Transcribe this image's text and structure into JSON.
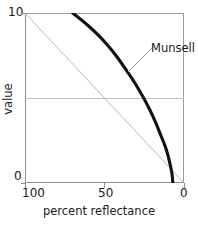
{
  "chart_data": {
    "type": "line",
    "title": "",
    "xlabel": "percent reflectance",
    "ylabel": "value",
    "xlim": [
      100,
      0
    ],
    "ylim": [
      0,
      10
    ],
    "x_reversed": true,
    "grid": "horizontal gridline at value = 5",
    "legend": "none (inline annotation)",
    "xticks": [
      100,
      50,
      0
    ],
    "xtick_labels": [
      "100",
      "50",
      "0"
    ],
    "yticks": [
      0,
      10
    ],
    "ytick_labels": [
      "0",
      "10"
    ],
    "annotations": [
      {
        "text": "Munsell",
        "points_to_series": "Munsell"
      }
    ],
    "series": [
      {
        "name": "Munsell",
        "style": "thick-black-curve",
        "color": "#111111",
        "width": 3.1,
        "x": [
          70,
          62,
          55,
          48,
          42,
          36,
          31,
          26,
          22,
          18,
          15,
          12,
          10,
          8.5,
          7.5,
          7
        ],
        "y": [
          10,
          9.4,
          8.8,
          8.1,
          7.4,
          6.6,
          5.9,
          5.1,
          4.4,
          3.6,
          2.9,
          2.2,
          1.6,
          1.0,
          0.5,
          0
        ]
      },
      {
        "name": "linear reference",
        "style": "thin-gray-line",
        "color": "#b0b0b0",
        "width": 0.9,
        "x": [
          100,
          0
        ],
        "y": [
          10,
          0
        ]
      }
    ]
  },
  "axes": {
    "y_top_label": "10",
    "y_bottom_label": "0",
    "y_title": "value",
    "x_left_label": "100",
    "x_mid_label": "50",
    "x_right_label": "0",
    "x_title": "percent reflectance"
  },
  "annotation": {
    "munsell_label": "Munsell"
  }
}
